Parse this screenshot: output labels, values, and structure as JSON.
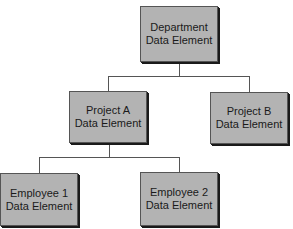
{
  "diagram": {
    "type": "hierarchy",
    "nodes": [
      {
        "id": "department",
        "line1": "Department",
        "line2": "Data Element"
      },
      {
        "id": "project_a",
        "line1": "Project A",
        "line2": "Data Element"
      },
      {
        "id": "project_b",
        "line1": "Project B",
        "line2": "Data Element"
      },
      {
        "id": "employee_1",
        "line1": "Employee 1",
        "line2": "Data Element"
      },
      {
        "id": "employee_2",
        "line1": "Employee 2",
        "line2": "Data Element"
      }
    ],
    "edges": [
      {
        "from": "department",
        "to": "project_a"
      },
      {
        "from": "department",
        "to": "project_b"
      },
      {
        "from": "project_a",
        "to": "employee_1"
      },
      {
        "from": "project_a",
        "to": "employee_2"
      }
    ],
    "colors": {
      "box_fill": "#b3b3b3",
      "border": "#1a1a1a",
      "line": "#555555"
    }
  }
}
